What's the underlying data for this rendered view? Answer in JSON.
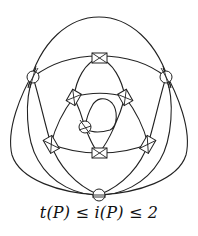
{
  "figure": {
    "caption": "t(P) ≤ i(P) ≤ 2",
    "marker_types": {
      "circle": "circled-crossing",
      "box": "boxed-crossing"
    },
    "circle_markers": [
      {
        "id": "c-left",
        "x": 33,
        "y": 77
      },
      {
        "id": "c-right",
        "x": 166,
        "y": 77
      },
      {
        "id": "c-bottom",
        "x": 99,
        "y": 195
      },
      {
        "id": "c-inner",
        "x": 85,
        "y": 127
      }
    ],
    "box_markers": [
      {
        "id": "b-top",
        "x": 99,
        "y": 58
      },
      {
        "id": "b-bottom",
        "x": 99,
        "y": 153
      },
      {
        "id": "b-left",
        "x": 51,
        "y": 144
      },
      {
        "id": "b-right",
        "x": 148,
        "y": 144
      },
      {
        "id": "b-upper-left",
        "x": 74,
        "y": 97
      },
      {
        "id": "b-upper-right",
        "x": 125,
        "y": 97
      }
    ],
    "colors": {
      "stroke": "#222222",
      "background": "#ffffff"
    }
  }
}
